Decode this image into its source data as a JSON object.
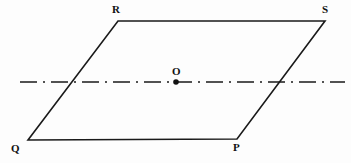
{
  "figure": {
    "kind": "geometry-diagram",
    "canvas": {
      "width": 351,
      "height": 163
    },
    "background_color": "#fdfdfd",
    "stroke_color": "#1a1a1a",
    "label_color": "#111111",
    "shape": {
      "name": "parallelogram",
      "vertex_order": "Q-P-S-R",
      "stroke_width": 1.6,
      "vertices": [
        {
          "id": "Q",
          "label": "Q",
          "x": 28,
          "y": 140,
          "label_x": 11,
          "label_y": 143
        },
        {
          "id": "P",
          "label": "P",
          "x": 237,
          "y": 139,
          "label_x": 233,
          "label_y": 142
        },
        {
          "id": "S",
          "label": "S",
          "x": 325,
          "y": 21,
          "label_x": 322,
          "label_y": 4
        },
        {
          "id": "R",
          "label": "R",
          "x": 118,
          "y": 21,
          "label_x": 112,
          "label_y": 4
        }
      ],
      "edges": [
        {
          "id": "QP",
          "from": "Q",
          "to": "P"
        },
        {
          "id": "PS",
          "from": "P",
          "to": "S"
        },
        {
          "id": "SR",
          "from": "S",
          "to": "R"
        },
        {
          "id": "RQ",
          "from": "R",
          "to": "Q"
        }
      ]
    },
    "center_point": {
      "id": "O",
      "label": "O",
      "x": 176,
      "y": 82,
      "radius": 2.8,
      "label_x": 172,
      "label_y": 66
    },
    "axis_line": {
      "id": "axis-of-symmetry",
      "style": "dash-dot",
      "x1": 20,
      "y1": 82,
      "x2": 345,
      "y2": 82,
      "stroke_width": 1.4,
      "dash_pattern": "17 6 2 6"
    }
  }
}
